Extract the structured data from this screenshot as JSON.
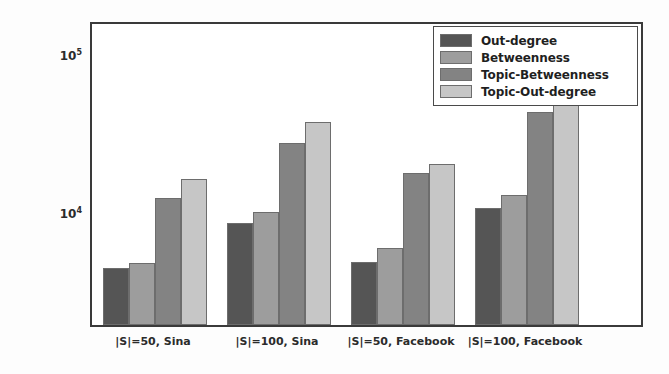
{
  "chart_data": {
    "type": "bar",
    "title": "",
    "xlabel": "",
    "ylabel": "Running time (in seconds)",
    "yscale": "log",
    "ylim": [
      4200,
      160000
    ],
    "grid": false,
    "legend_position": "upper right",
    "categories": [
      "|S|=50, Sina",
      "|S|=100, Sina",
      "|S|=50, Facebook",
      "|S|=100, Facebook"
    ],
    "series": [
      {
        "name": "Out-degree",
        "color": "#555555",
        "values": [
          4630,
          8900,
          5060,
          11100
        ]
      },
      {
        "name": "Betweenness",
        "color": "#9d9d9d",
        "values": [
          5000,
          10450,
          6150,
          13400
        ]
      },
      {
        "name": "Topic-Betweenness",
        "color": "#838383",
        "values": [
          12800,
          28500,
          18500,
          45000
        ]
      },
      {
        "name": "Topic-Out-degree",
        "color": "#c6c6c6",
        "values": [
          17000,
          39000,
          21000,
          52000
        ]
      }
    ],
    "y_major_ticks": [
      {
        "value": 100000,
        "label_base": "10",
        "label_exp": "5"
      },
      {
        "value": 10000,
        "label_base": "10",
        "label_exp": "4"
      }
    ],
    "y_minor_tick_values": [
      90000,
      80000,
      70000,
      60000,
      50000,
      40000,
      30000,
      20000,
      9000,
      8000,
      7000,
      6000,
      5000
    ]
  },
  "legend": {
    "items": [
      {
        "label": "Out-degree"
      },
      {
        "label": "Betweenness"
      },
      {
        "label": "Topic-Betweenness"
      },
      {
        "label": "Topic-Out-degree"
      }
    ]
  },
  "axes": {
    "y_label": "Running time (in seconds)"
  }
}
